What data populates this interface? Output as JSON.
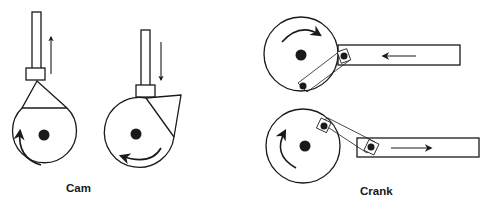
{
  "diagram": {
    "colors": {
      "stroke": "#1a1a1a",
      "fill": "#ffffff",
      "background": "#ffffff"
    },
    "groups": [
      {
        "label": "Cam",
        "items": [
          {
            "name": "cam-rising",
            "motion": "up",
            "rotation": "counterclockwise"
          },
          {
            "name": "cam-falling",
            "motion": "down",
            "rotation": "clockwise"
          }
        ]
      },
      {
        "label": "Crank",
        "items": [
          {
            "name": "crank-pulling",
            "motion": "left",
            "rotation": "clockwise"
          },
          {
            "name": "crank-pushing",
            "motion": "right",
            "rotation": "clockwise"
          }
        ]
      }
    ]
  }
}
